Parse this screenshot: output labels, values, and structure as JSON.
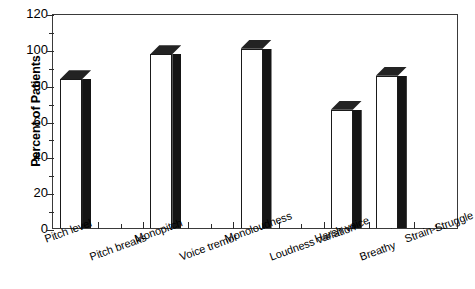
{
  "chart_data": {
    "type": "bar",
    "title": "",
    "subtitle": "",
    "xlabel": "",
    "ylabel": "Percent of Patients",
    "ylim": [
      0,
      120
    ],
    "ytick_labels": [
      "0",
      "20",
      "40",
      "60",
      "80",
      "100",
      "120"
    ],
    "ytick_values": [
      0,
      20,
      40,
      60,
      80,
      100,
      120
    ],
    "yminor_values": [
      10,
      30,
      50,
      70,
      90,
      110
    ],
    "grid": false,
    "legend": null,
    "categories": [
      "Pitch level",
      "Pitch breaks",
      "Monopitch",
      "Voice tremor",
      "Monoloudness",
      "Loudness variation",
      "Harsh voice",
      "Breathy",
      "Strain-Struggle"
    ],
    "values": [
      83,
      0,
      97,
      0,
      100,
      0,
      66,
      85,
      0
    ],
    "bars": [
      {
        "category": "Pitch level",
        "value": 83
      },
      {
        "category": "Pitch breaks",
        "value": 0
      },
      {
        "category": "Monopitch",
        "value": 97
      },
      {
        "category": "Voice tremor",
        "value": 0
      },
      {
        "category": "Monoloudness",
        "value": 100
      },
      {
        "category": "Loudness variation",
        "value": 0
      },
      {
        "category": "Harsh voice",
        "value": 66
      },
      {
        "category": "Breathy",
        "value": 85
      },
      {
        "category": "Strain-Struggle",
        "value": 0
      }
    ],
    "colors": {
      "bar_face": "#ffffff",
      "bar_side": "#151515",
      "bar_top": "#232323",
      "axis": "#2b2b2b",
      "frame": "#3a3a3a",
      "text": "#000000",
      "background": "#ffffff"
    }
  }
}
